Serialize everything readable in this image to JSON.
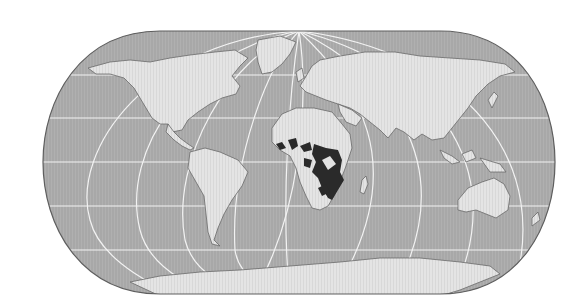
{
  "map": {
    "projection": "pseudocylindrical (Eckert IV-like), oblique graticule",
    "colors": {
      "background": "#ffffff",
      "ocean": "#a9a9a9",
      "land": "#e2e2e2",
      "coast": "#6a6a6a",
      "graticule": "#f4f4f4",
      "highlight": "#2a2a2a",
      "border": "#5e5e5e"
    },
    "highlighted_region": "Central Africa (dark shaded areas)",
    "continents": [
      "North America",
      "South America",
      "Greenland",
      "Europe",
      "Asia",
      "Africa",
      "Australia",
      "Antarctica"
    ],
    "graticule": {
      "parallels_y": [
        75,
        118,
        162,
        206,
        250
      ],
      "meridian_count": 11
    }
  }
}
